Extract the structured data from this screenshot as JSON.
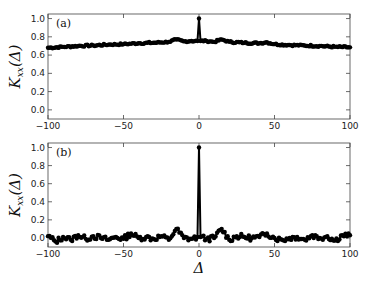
{
  "chart_data": [
    {
      "type": "line",
      "panel_label": "(a)",
      "title": "",
      "xlabel": "",
      "ylabel": "K_xx(Δ)",
      "xlim": [
        -100,
        100
      ],
      "ylim": [
        -0.1,
        1.05
      ],
      "xticks": [
        -100,
        -50,
        0,
        50,
        100
      ],
      "yticks": [
        0.0,
        0.2,
        0.4,
        0.6,
        0.8,
        1.0
      ],
      "ytick_labels": [
        "0.0",
        "0.2",
        "0.4",
        "0.6",
        "0.8",
        "1.0"
      ],
      "grid": false,
      "marker": "circle",
      "description": "Slowly varying baseline ~0.68 at Δ=-100 rising to ~0.75 near Δ=0, then decreasing to ~0.68 at Δ=100, with a sharp peak of 1.0 at Δ=0 and small bumps (~0.77) at Δ=±15",
      "x": [
        -100,
        -90,
        -80,
        -70,
        -60,
        -50,
        -40,
        -30,
        -20,
        -15,
        -10,
        -5,
        -1,
        0,
        1,
        5,
        10,
        15,
        20,
        30,
        40,
        45,
        50,
        60,
        70,
        80,
        90,
        100
      ],
      "y": [
        0.68,
        0.69,
        0.7,
        0.705,
        0.715,
        0.72,
        0.73,
        0.735,
        0.745,
        0.77,
        0.75,
        0.755,
        0.755,
        1.0,
        0.755,
        0.755,
        0.745,
        0.77,
        0.745,
        0.735,
        0.73,
        0.74,
        0.72,
        0.71,
        0.705,
        0.7,
        0.69,
        0.685
      ]
    },
    {
      "type": "line",
      "panel_label": "(b)",
      "title": "",
      "xlabel": "Δ",
      "ylabel": "K_xx(Δ)",
      "xlim": [
        -100,
        100
      ],
      "ylim": [
        -0.1,
        1.05
      ],
      "xticks": [
        -100,
        -50,
        0,
        50,
        100
      ],
      "yticks": [
        0.0,
        0.2,
        0.4,
        0.6,
        0.8,
        1.0
      ],
      "ytick_labels": [
        "0.0",
        "0.2",
        "0.4",
        "0.6",
        "0.8",
        "1.0"
      ],
      "grid": false,
      "marker": "circle",
      "description": "Noise around 0.0 (range about -0.05 to 0.05), sharp peak 1.0 at Δ=0, small bumps ~0.1 at Δ=±15 and ~0.05 at Δ=±45",
      "x": [
        -100,
        -95,
        -90,
        -85,
        -80,
        -75,
        -70,
        -65,
        -60,
        -55,
        -50,
        -45,
        -40,
        -35,
        -30,
        -25,
        -20,
        -15,
        -10,
        -5,
        -1,
        0,
        1,
        5,
        10,
        15,
        20,
        25,
        30,
        35,
        40,
        45,
        50,
        55,
        60,
        65,
        70,
        75,
        80,
        85,
        90,
        95,
        100
      ],
      "y": [
        0.02,
        -0.04,
        0.01,
        -0.02,
        0.03,
        -0.01,
        0.02,
        0.0,
        -0.02,
        0.01,
        -0.01,
        0.05,
        0.0,
        0.01,
        -0.01,
        0.02,
        -0.02,
        0.1,
        0.0,
        -0.01,
        0.01,
        1.0,
        0.01,
        -0.01,
        0.0,
        0.1,
        -0.02,
        0.02,
        0.01,
        0.0,
        0.01,
        0.05,
        0.0,
        -0.02,
        0.0,
        0.01,
        -0.02,
        0.03,
        0.0,
        0.02,
        -0.03,
        0.03,
        0.03
      ]
    }
  ]
}
